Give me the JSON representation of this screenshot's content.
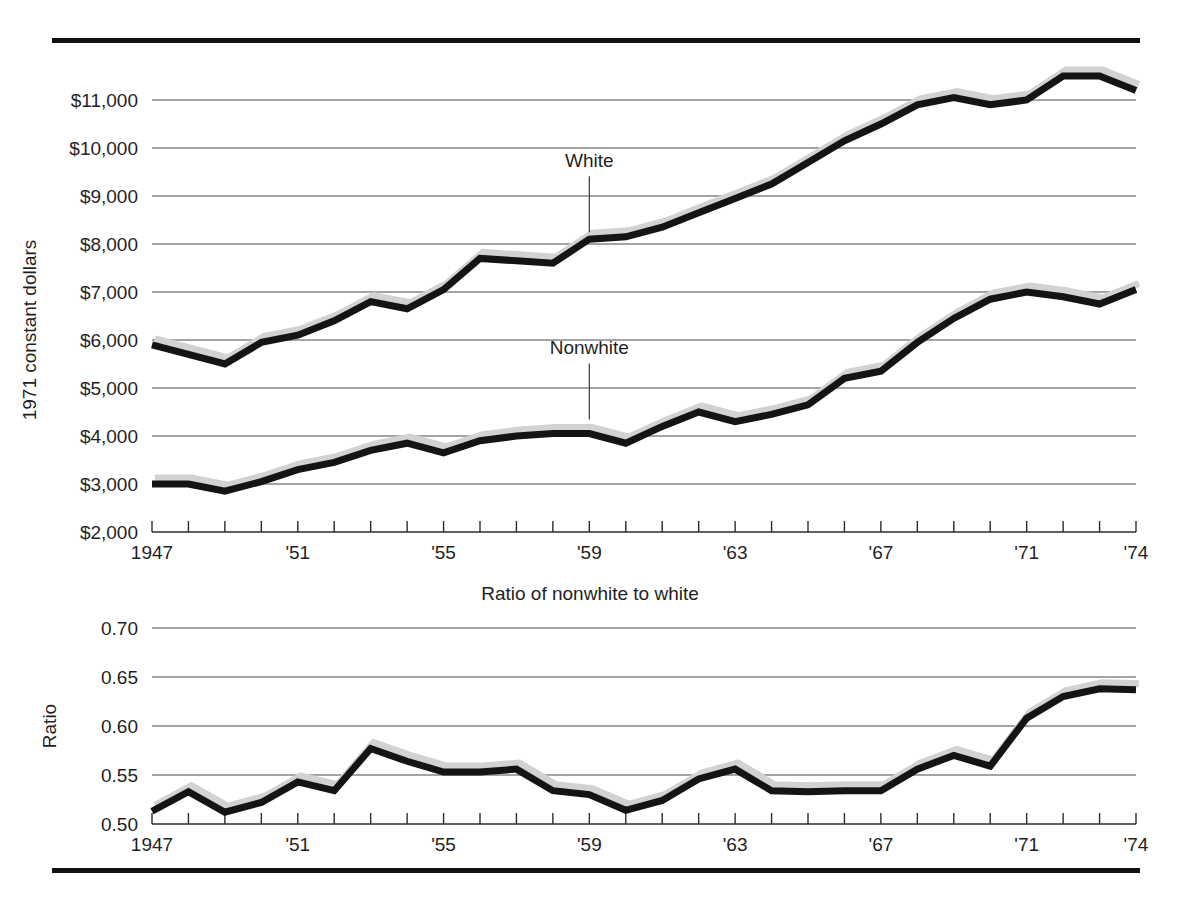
{
  "figure": {
    "top_rule": "horizontal-rule",
    "bottom_rule": "horizontal-rule"
  },
  "chart_data": [
    {
      "id": "income-panel",
      "type": "line",
      "title": "",
      "xlabel": "",
      "ylabel": "1971 constant dollars",
      "xlim": [
        1947,
        1974
      ],
      "ylim": [
        2000,
        11500
      ],
      "grid": true,
      "legend": "inline-annotations",
      "ytick_labels": [
        "$11,000",
        "$10,000",
        "$9,000",
        "$8,000",
        "$7,000",
        "$6,000",
        "$5,000",
        "$4,000",
        "$3,000",
        "$2,000"
      ],
      "ytick_values": [
        11000,
        10000,
        9000,
        8000,
        7000,
        6000,
        5000,
        4000,
        3000,
        2000
      ],
      "xtick_labels": [
        "1947",
        "'51",
        "'55",
        "'59",
        "'63",
        "'67",
        "'71",
        "'74"
      ],
      "xtick_values": [
        1947,
        1951,
        1955,
        1959,
        1963,
        1967,
        1971,
        1974
      ],
      "x": [
        1947,
        1948,
        1949,
        1950,
        1951,
        1952,
        1953,
        1954,
        1955,
        1956,
        1957,
        1958,
        1959,
        1960,
        1961,
        1962,
        1963,
        1964,
        1965,
        1966,
        1967,
        1968,
        1969,
        1970,
        1971,
        1972,
        1973,
        1974
      ],
      "series": [
        {
          "name": "White",
          "label_x": 1959,
          "label_value": 8100,
          "values": [
            5900,
            5700,
            5500,
            5950,
            6100,
            6400,
            6800,
            6650,
            7050,
            7700,
            7650,
            7600,
            8100,
            8150,
            8350,
            8650,
            8950,
            9250,
            9700,
            10150,
            10500,
            10900,
            11050,
            10900,
            11000,
            11500,
            11500,
            11200
          ]
        },
        {
          "name": "Nonwhite",
          "label_x": 1959,
          "label_value": 4200,
          "values": [
            3000,
            3000,
            2850,
            3050,
            3300,
            3450,
            3700,
            3850,
            3650,
            3900,
            4000,
            4050,
            4050,
            3850,
            4200,
            4500,
            4300,
            4450,
            4650,
            5200,
            5350,
            5950,
            6450,
            6850,
            7000,
            6900,
            6750,
            7050,
            6850
          ]
        }
      ]
    },
    {
      "id": "ratio-panel",
      "type": "line",
      "title": "Ratio of nonwhite to white",
      "xlabel": "",
      "ylabel": "Ratio",
      "xlim": [
        1947,
        1974
      ],
      "ylim": [
        0.5,
        0.7
      ],
      "grid": true,
      "ytick_labels": [
        "0.70",
        "0.65",
        "0.60",
        "0.55",
        "0.50"
      ],
      "ytick_values": [
        0.7,
        0.65,
        0.6,
        0.55,
        0.5
      ],
      "xtick_labels": [
        "1947",
        "'51",
        "'55",
        "'59",
        "'63",
        "'67",
        "'71",
        "'74"
      ],
      "xtick_values": [
        1947,
        1951,
        1955,
        1959,
        1963,
        1967,
        1971,
        1974
      ],
      "x": [
        1947,
        1948,
        1949,
        1950,
        1951,
        1952,
        1953,
        1954,
        1955,
        1956,
        1957,
        1958,
        1959,
        1960,
        1961,
        1962,
        1963,
        1964,
        1965,
        1966,
        1967,
        1968,
        1969,
        1970,
        1971,
        1972,
        1973,
        1974
      ],
      "series": [
        {
          "name": "Ratio of nonwhite to white",
          "values": [
            0.513,
            0.533,
            0.512,
            0.522,
            0.543,
            0.534,
            0.577,
            0.564,
            0.553,
            0.553,
            0.556,
            0.534,
            0.53,
            0.514,
            0.524,
            0.546,
            0.556,
            0.534,
            0.533,
            0.534,
            0.534,
            0.556,
            0.57,
            0.559,
            0.608,
            0.63,
            0.638,
            0.637,
            0.648,
            0.632,
            0.612,
            0.613
          ]
        }
      ]
    }
  ],
  "colors": {
    "line": "#141414",
    "shadow": "#d2d2d2",
    "grid": "#4a4a4a",
    "rule": "#111111",
    "text": "#1f1f1f"
  }
}
